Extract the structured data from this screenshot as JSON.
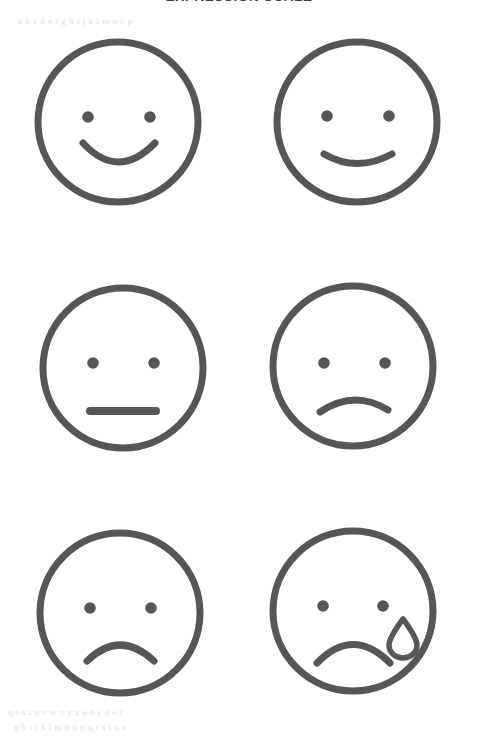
{
  "document": {
    "title": "EXPRESSION SCALE",
    "background_color": "#ffffff",
    "stroke_color": "#565659",
    "width": 478,
    "height": 746
  },
  "artifacts": {
    "note": "faint scanner ghost text bleed-through, illegible",
    "lines": [
      "a b c d e f g h i j k l m n o p",
      "q r s t u v w x y z a b c d e f",
      "g h i j k l m n o p q r s t u v"
    ]
  },
  "scale": {
    "columns": 2,
    "rows": 3,
    "count": 6,
    "faces": [
      {
        "id": "face-1",
        "position": "top-left",
        "name": "happy-face",
        "expression": "happy",
        "mouth": "big-smile",
        "has_tear": false,
        "label": "Happy"
      },
      {
        "id": "face-2",
        "position": "top-right",
        "name": "slightly-happy-face",
        "expression": "slightly-happy",
        "mouth": "slight-smile",
        "has_tear": false,
        "label": "Slightly Happy"
      },
      {
        "id": "face-3",
        "position": "middle-left",
        "name": "neutral-face",
        "expression": "neutral",
        "mouth": "straight-line",
        "has_tear": false,
        "label": "Neutral"
      },
      {
        "id": "face-4",
        "position": "middle-right",
        "name": "slightly-sad-face",
        "expression": "slightly-sad",
        "mouth": "slight-frown",
        "has_tear": false,
        "label": "Slightly Sad"
      },
      {
        "id": "face-5",
        "position": "bottom-left",
        "name": "sad-face",
        "expression": "sad",
        "mouth": "frown",
        "has_tear": false,
        "label": "Sad"
      },
      {
        "id": "face-6",
        "position": "bottom-right",
        "name": "crying-face",
        "expression": "crying",
        "mouth": "deep-frown",
        "has_tear": true,
        "label": "Crying"
      }
    ]
  }
}
